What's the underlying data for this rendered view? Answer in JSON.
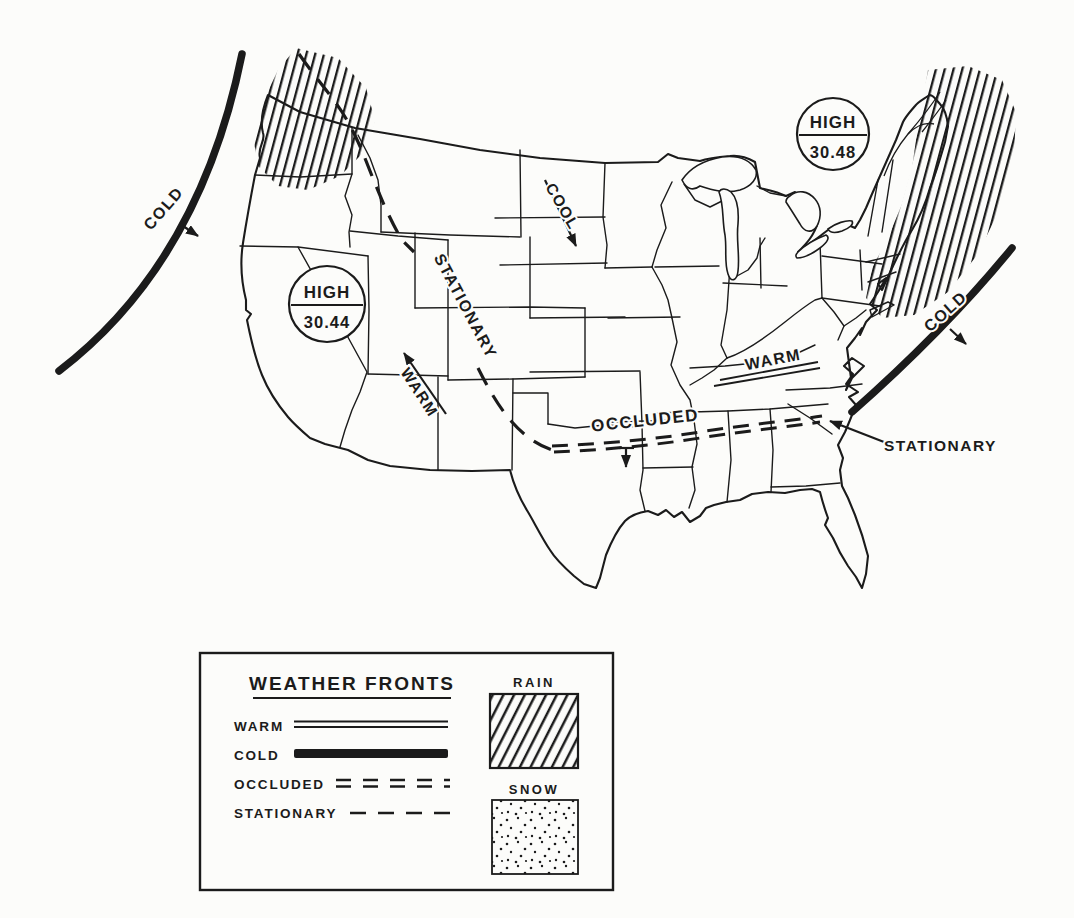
{
  "colors": {
    "ink": "#1b1b1b",
    "paper": "#fcfcfa"
  },
  "map": {
    "pressure_systems": [
      {
        "label": "HIGH",
        "value": "30.44",
        "position": "west"
      },
      {
        "label": "HIGH",
        "value": "30.48",
        "position": "northeast"
      }
    ],
    "front_labels": {
      "cold_west": "COLD",
      "cold_east": "COLD",
      "stationary_along_line": "STATIONARY",
      "stationary_callout": "STATIONARY",
      "occluded": "OCCLUDED",
      "warm_front": "WARM"
    },
    "air_flow_labels": {
      "cool": "COOL",
      "warm": "WARM"
    }
  },
  "legend": {
    "title": "WEATHER FRONTS",
    "front_types": [
      {
        "label": "WARM",
        "symbol": "double-line"
      },
      {
        "label": "COLD",
        "symbol": "thick-solid-line"
      },
      {
        "label": "OCCLUDED",
        "symbol": "double-dashed-line"
      },
      {
        "label": "STATIONARY",
        "symbol": "dashed-line"
      }
    ],
    "precipitation_areas": [
      {
        "label": "RAIN",
        "pattern": "diagonal-hatch"
      },
      {
        "label": "SNOW",
        "pattern": "stipple-dots"
      }
    ]
  }
}
